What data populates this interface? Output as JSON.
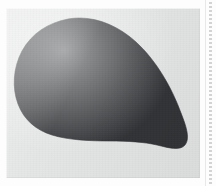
{
  "figure": {
    "caption": "",
    "alt_text": "Solid dark charcoal teardrop / leaf-blade shaped silhouette, broad and rounded at the upper left, tapering to a rounded point at the lower right, centered on a light gray scanned plate with white page margins."
  },
  "canvas": {
    "width": 216,
    "height": 186,
    "page_background": "#fdfdfd"
  },
  "plate": {
    "name": "image-plate",
    "left": 6,
    "top": 8,
    "width": 194,
    "height": 170,
    "background_color": "#e4e5e5"
  },
  "specimen": {
    "name": "specimen-silhouette",
    "fill_color": "#313336",
    "stroke_color": "#2b2d30",
    "shape": "teardrop",
    "orientation": "tapering toward lower-right",
    "bounding_box": {
      "x": 8,
      "y": 10,
      "width": 178,
      "height": 138
    },
    "apex_point": {
      "x": 174,
      "y": 137
    },
    "widest_point": {
      "x": 70,
      "y": 14
    }
  },
  "margin_rules": {
    "right_dotted_rule": {
      "name": "right-dotted-rule",
      "color": "#787878",
      "style": "dotted",
      "orientation": "vertical"
    },
    "right_hairline": {
      "name": "right-hairline",
      "color": "#aaaaaa",
      "style": "solid",
      "orientation": "vertical"
    }
  },
  "chart_data": {
    "type": "table",
    "xlabel": "",
    "ylabel": "",
    "categories": [
      "specimen-silhouette"
    ],
    "values": [
      1
    ],
    "annotations": []
  }
}
